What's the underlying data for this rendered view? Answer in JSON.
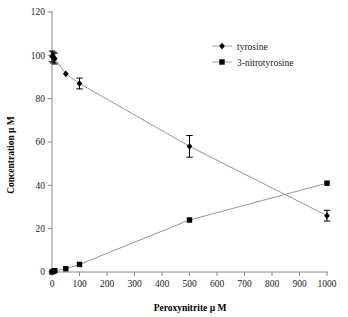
{
  "chart_data": {
    "type": "scatter",
    "title": "",
    "xlabel": "Peroxynitrite μ M",
    "ylabel": "Concentration μ M",
    "xlim": [
      0,
      1000
    ],
    "ylim": [
      0,
      120
    ],
    "xticks": [
      0,
      100,
      200,
      300,
      400,
      500,
      600,
      700,
      800,
      900,
      1000
    ],
    "xtick_labels": [
      "0",
      "100",
      "200",
      "300",
      "400",
      "500",
      "600",
      "700",
      "800",
      "900",
      "1000"
    ],
    "yticks": [
      0,
      20,
      40,
      60,
      80,
      100,
      120
    ],
    "ytick_labels": [
      "0",
      "20",
      "40",
      "60",
      "80",
      "100",
      "120"
    ],
    "grid": false,
    "frame": false,
    "legend_position": "top-right",
    "series": [
      {
        "name": "tyrosine",
        "marker": "diamond",
        "color": "#000000",
        "x": [
          0,
          5,
          10,
          50,
          100,
          500,
          1000
        ],
        "y": [
          99.5,
          99.0,
          98.5,
          91.5,
          87.0,
          58.0,
          26.0
        ],
        "yerr": [
          2.5,
          2.5,
          2.5,
          0,
          2.5,
          5.0,
          2.5
        ]
      },
      {
        "name": "3-nitrotyrosine",
        "marker": "square",
        "color": "#000000",
        "x": [
          0,
          5,
          10,
          50,
          100,
          500,
          1000
        ],
        "y": [
          0.0,
          0.3,
          0.6,
          1.5,
          3.5,
          24.0,
          41.0
        ],
        "yerr": [
          0,
          0,
          0,
          0,
          0,
          0,
          0
        ]
      }
    ]
  },
  "legend": {
    "items": [
      {
        "label": "tyrosine",
        "marker": "diamond-marker-icon"
      },
      {
        "label": "3-nitrotyrosine",
        "marker": "square-marker-icon"
      }
    ]
  },
  "axes": {
    "x_title": "Peroxynitrite μ M",
    "y_title": "Concentration μ M"
  }
}
